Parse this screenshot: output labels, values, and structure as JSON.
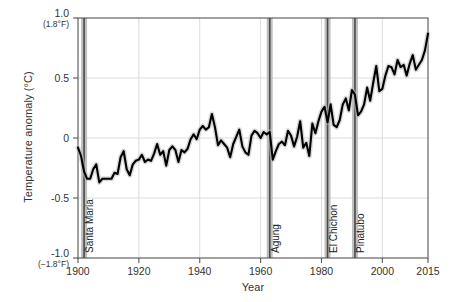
{
  "chart_data": {
    "type": "line",
    "title": "",
    "xlabel": "Year",
    "ylabel": "Temperature anomaly (°C)",
    "xlim": [
      1900,
      2015
    ],
    "ylim": [
      -1.0,
      1.0
    ],
    "grid": true,
    "legend": "none",
    "xticks": [
      1900,
      1920,
      1940,
      1960,
      1980,
      2000,
      2015
    ],
    "xtick_labels": [
      "1900",
      "1920",
      "1940",
      "1960",
      "1980",
      "2000",
      "2015"
    ],
    "yticks": [
      -1.0,
      -0.5,
      0,
      0.5,
      1.0
    ],
    "ytick_labels": [
      "-1.0",
      "-0.5",
      "0",
      "0.5",
      "1.0"
    ],
    "ytick_sublabels": {
      "1.0": "(1.8°F)",
      "-1.0": "(−1.8°F)"
    },
    "series": [
      {
        "name": "Global temperature anomaly",
        "color": "#000000",
        "x": [
          1900,
          1901,
          1902,
          1903,
          1904,
          1905,
          1906,
          1907,
          1908,
          1909,
          1910,
          1911,
          1912,
          1913,
          1914,
          1915,
          1916,
          1917,
          1918,
          1919,
          1920,
          1921,
          1922,
          1923,
          1924,
          1925,
          1926,
          1927,
          1928,
          1929,
          1930,
          1931,
          1932,
          1933,
          1934,
          1935,
          1936,
          1937,
          1938,
          1939,
          1940,
          1941,
          1942,
          1943,
          1944,
          1945,
          1946,
          1947,
          1948,
          1949,
          1950,
          1951,
          1952,
          1953,
          1954,
          1955,
          1956,
          1957,
          1958,
          1959,
          1960,
          1961,
          1962,
          1963,
          1964,
          1965,
          1966,
          1967,
          1968,
          1969,
          1970,
          1971,
          1972,
          1973,
          1974,
          1975,
          1976,
          1977,
          1978,
          1979,
          1980,
          1981,
          1982,
          1983,
          1984,
          1985,
          1986,
          1987,
          1988,
          1989,
          1990,
          1991,
          1992,
          1993,
          1994,
          1995,
          1996,
          1997,
          1998,
          1999,
          2000,
          2001,
          2002,
          2003,
          2004,
          2005,
          2006,
          2007,
          2008,
          2009,
          2010,
          2011,
          2012,
          2013,
          2014,
          2015
        ],
        "values": [
          -0.08,
          -0.15,
          -0.28,
          -0.34,
          -0.34,
          -0.26,
          -0.22,
          -0.37,
          -0.34,
          -0.34,
          -0.34,
          -0.34,
          -0.29,
          -0.3,
          -0.16,
          -0.11,
          -0.26,
          -0.31,
          -0.22,
          -0.19,
          -0.18,
          -0.14,
          -0.2,
          -0.18,
          -0.19,
          -0.13,
          -0.05,
          -0.14,
          -0.11,
          -0.23,
          -0.1,
          -0.07,
          -0.1,
          -0.2,
          -0.1,
          -0.12,
          -0.09,
          -0.01,
          0.03,
          -0.01,
          0.07,
          0.1,
          0.07,
          0.09,
          0.2,
          0.09,
          -0.06,
          -0.02,
          -0.05,
          -0.08,
          -0.16,
          -0.05,
          0.01,
          0.07,
          -0.07,
          -0.12,
          -0.14,
          0.02,
          0.06,
          0.04,
          0.0,
          0.05,
          0.03,
          0.05,
          -0.18,
          -0.11,
          -0.05,
          -0.03,
          -0.06,
          0.06,
          0.02,
          -0.07,
          0.01,
          0.14,
          -0.08,
          -0.04,
          -0.15,
          0.12,
          0.04,
          0.14,
          0.22,
          0.26,
          0.13,
          0.28,
          0.11,
          0.09,
          0.15,
          0.28,
          0.33,
          0.23,
          0.4,
          0.36,
          0.19,
          0.22,
          0.28,
          0.42,
          0.31,
          0.46,
          0.6,
          0.39,
          0.41,
          0.52,
          0.6,
          0.59,
          0.53,
          0.65,
          0.59,
          0.61,
          0.52,
          0.62,
          0.69,
          0.57,
          0.61,
          0.65,
          0.73,
          0.87
        ]
      }
    ],
    "volcano_events": [
      {
        "name": "Santa Maria",
        "year": 1902
      },
      {
        "name": "Agung",
        "year": 1963
      },
      {
        "name": "El Chichon",
        "year": 1982
      },
      {
        "name": "Pinatubo",
        "year": 1991
      }
    ]
  }
}
